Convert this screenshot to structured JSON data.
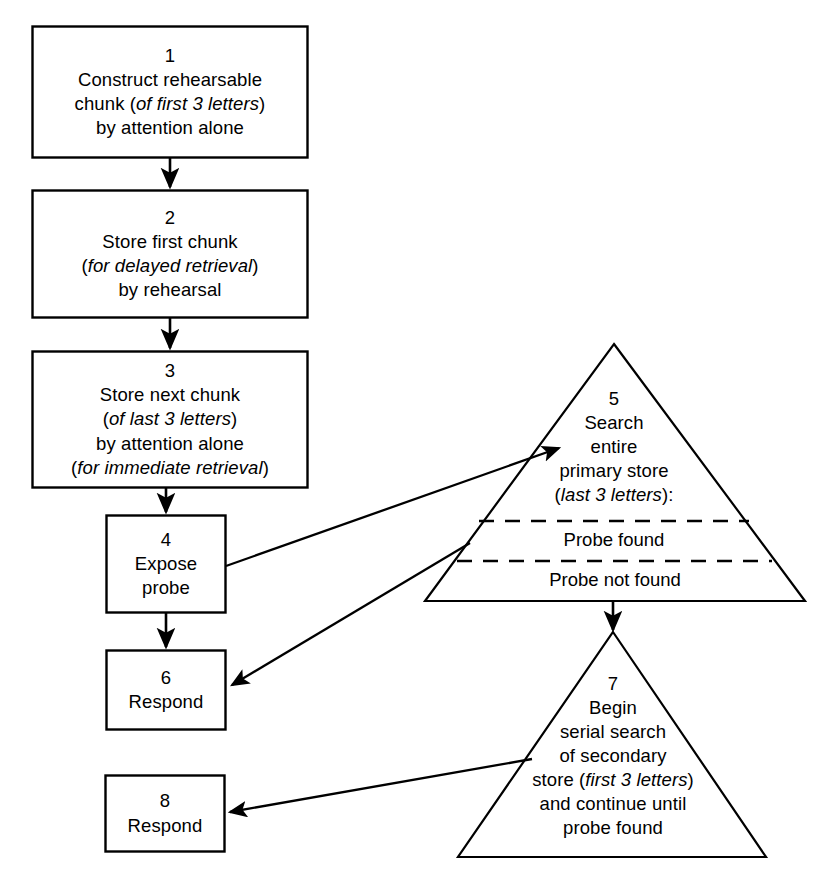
{
  "diagram": {
    "background_color": "#ffffff",
    "stroke_color": "#000000"
  },
  "nodes": {
    "n1": {
      "shape": "rectangle",
      "number": "1",
      "lines": [
        "Construct rehearsable",
        "chunk (of first 3 letters)",
        "by attention alone"
      ],
      "italic_parts": [
        "of first 3 letters"
      ]
    },
    "n2": {
      "shape": "rectangle",
      "number": "2",
      "lines": [
        "Store first chunk",
        "(for delayed retrieval)",
        "by rehearsal"
      ],
      "italic_parts": [
        "for delayed retrieval"
      ]
    },
    "n3": {
      "shape": "rectangle",
      "number": "3",
      "lines": [
        "Store next chunk",
        "(of last 3 letters)",
        "by attention alone",
        "(for immediate retrieval)"
      ],
      "italic_parts": [
        "of last 3 letters",
        "for immediate retrieval"
      ]
    },
    "n4": {
      "shape": "rectangle",
      "number": "4",
      "lines": [
        "Expose",
        "probe"
      ],
      "italic_parts": []
    },
    "n5": {
      "shape": "triangle",
      "number": "5",
      "lines": [
        "Search",
        "entire",
        "primary store",
        "(last 3 letters):"
      ],
      "italic_parts": [
        "last 3 letters"
      ],
      "outcome_found": "Probe found",
      "outcome_not_found": "Probe not found"
    },
    "n6": {
      "shape": "rectangle",
      "number": "6",
      "lines": [
        "Respond"
      ],
      "italic_parts": []
    },
    "n7": {
      "shape": "triangle",
      "number": "7",
      "lines": [
        "Begin",
        "serial search",
        "of secondary",
        "store (first 3 letters)",
        "and continue until",
        "probe found"
      ],
      "italic_parts": [
        "first 3 letters"
      ]
    },
    "n8": {
      "shape": "rectangle",
      "number": "8",
      "lines": [
        "Respond"
      ],
      "italic_parts": []
    }
  },
  "edges": [
    {
      "name": "edge-1-to-2",
      "from": "1",
      "to": "2",
      "style": "solid-arrow-down"
    },
    {
      "name": "edge-2-to-3",
      "from": "2",
      "to": "3",
      "style": "solid-arrow-down"
    },
    {
      "name": "edge-3-to-4",
      "from": "3",
      "to": "4",
      "style": "solid-arrow-down"
    },
    {
      "name": "edge-4-to-6",
      "from": "4",
      "to": "6",
      "style": "solid-arrow-down"
    },
    {
      "name": "edge-4-to-5",
      "from": "4",
      "to": "5",
      "style": "solid-arrow-diagonal-up-right"
    },
    {
      "name": "edge-5-found-to-6",
      "from": "5",
      "to": "6",
      "style": "solid-arrow-diagonal-down-left"
    },
    {
      "name": "edge-5-notfound-to-7",
      "from": "5",
      "to": "7",
      "style": "solid-arrow-down"
    },
    {
      "name": "edge-7-to-8",
      "from": "7",
      "to": "8",
      "style": "solid-arrow-diagonal-down-left"
    }
  ]
}
